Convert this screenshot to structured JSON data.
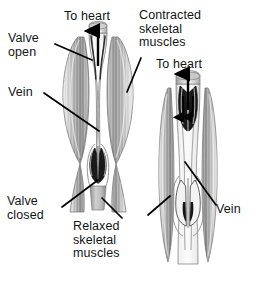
{
  "figure": {
    "type": "anatomical-diagram",
    "panels": [
      {
        "id": "left-panel",
        "name": "contracted-muscle-panel",
        "state": "Contracted skeletal muscles",
        "blood_flow": "upward, toward heart",
        "valve_upper": "open",
        "valve_lower": "closed"
      },
      {
        "id": "right-panel",
        "name": "relaxed-muscle-panel",
        "state": "Relaxed skeletal muscles",
        "blood_flow": "upward with backflow filling valve cusps",
        "valve_upper": "closing",
        "valve_lower": "closed"
      }
    ]
  },
  "labels": {
    "valve_open": "Valve\nopen",
    "to_heart_left": "To heart",
    "vein_left": "Vein",
    "valve_closed": "Valve\nclosed",
    "contracted_muscles": "Contracted\nskeletal\nmuscles",
    "to_heart_right": "To heart",
    "relaxed_muscles": "Relaxed\nskeletal\nmuscles",
    "vein_right": "Vein"
  },
  "colors": {
    "background": "#ffffff",
    "text": "#141414",
    "leader_line": "#000000",
    "muscle_light": "#efefef",
    "muscle_mid": "#c9c9c9",
    "muscle_dark": "#8e8e8e",
    "muscle_shadow": "#6b6b6b",
    "vein_light": "#f4f4f4",
    "vein_shade": "#bdbdbd",
    "valve_dark": "#151515",
    "outline": "#4a4a4a",
    "arrow": "#000000"
  },
  "icons": {
    "flow_arrow_up": "arrow-up-icon",
    "flow_arrow_down": "arrow-down-icon",
    "leader": "leader-line-icon"
  }
}
